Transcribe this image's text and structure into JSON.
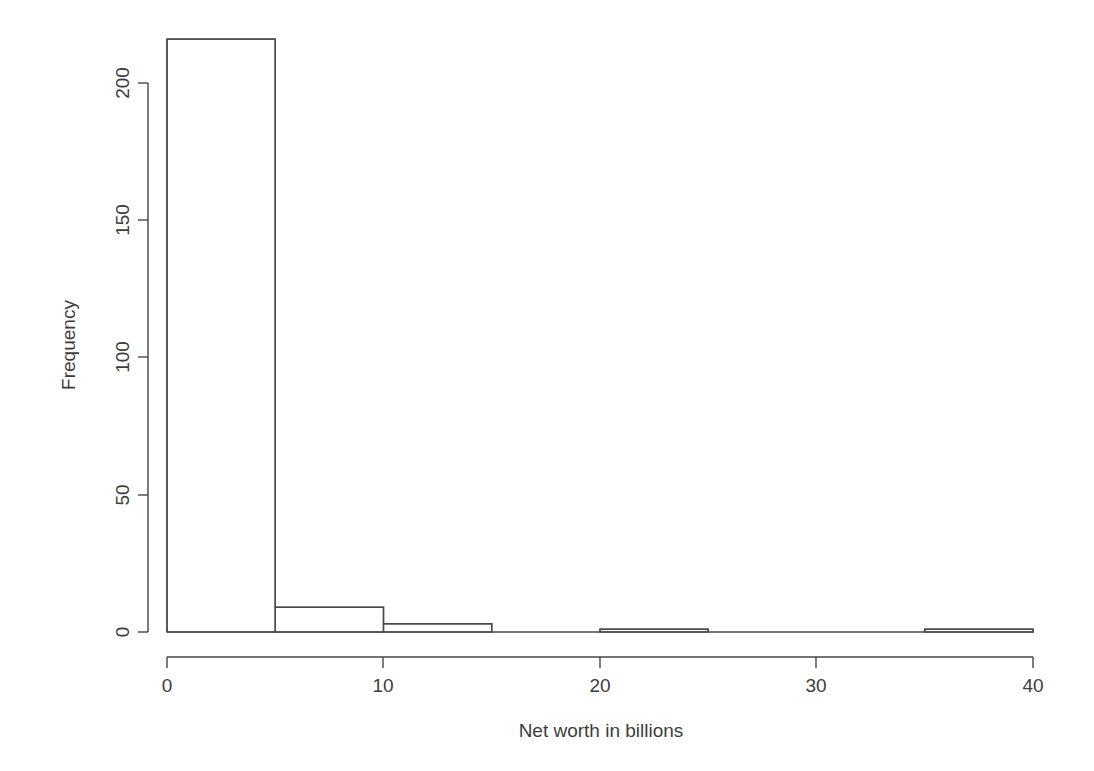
{
  "chart_data": {
    "type": "bar",
    "subtype": "histogram",
    "title": "",
    "xlabel": "Net worth in billions",
    "ylabel": "Frequency",
    "xlim": [
      0,
      40
    ],
    "ylim": [
      0,
      216
    ],
    "grid": false,
    "legend": null,
    "bin_width": 5,
    "bin_edges": [
      0,
      5,
      10,
      15,
      20,
      25,
      30,
      35,
      40
    ],
    "categories": [
      "0-5",
      "5-10",
      "10-15",
      "15-20",
      "20-25",
      "25-30",
      "30-35",
      "35-40"
    ],
    "values": [
      216,
      9,
      3,
      0,
      1,
      0,
      0,
      1
    ],
    "bars": [
      {
        "x0": 0,
        "x1": 5,
        "value": 216
      },
      {
        "x0": 5,
        "x1": 10,
        "value": 9
      },
      {
        "x0": 10,
        "x1": 15,
        "value": 3
      },
      {
        "x0": 15,
        "x1": 20,
        "value": 0
      },
      {
        "x0": 20,
        "x1": 25,
        "value": 1
      },
      {
        "x0": 25,
        "x1": 30,
        "value": 0
      },
      {
        "x0": 30,
        "x1": 35,
        "value": 0
      },
      {
        "x0": 35,
        "x1": 40,
        "value": 1
      }
    ],
    "xticks": [
      0,
      10,
      20,
      30,
      40
    ],
    "xtick_labels": [
      "0",
      "10",
      "20",
      "30",
      "40"
    ],
    "yticks": [
      0,
      50,
      100,
      150,
      200
    ],
    "ytick_labels": [
      "0",
      "50",
      "100",
      "150",
      "200"
    ],
    "colors": {
      "background": "#ffffff",
      "axis": "#454545",
      "bar_stroke": "#4a4a4a",
      "bar_fill": "none",
      "text": "#3d3d3d"
    }
  },
  "axes": {
    "y": {
      "title": "Frequency",
      "tick_labels": [
        "0",
        "50",
        "100",
        "150",
        "200"
      ]
    },
    "x": {
      "title": "Net worth in billions",
      "tick_labels": [
        "0",
        "10",
        "20",
        "30",
        "40"
      ]
    }
  }
}
